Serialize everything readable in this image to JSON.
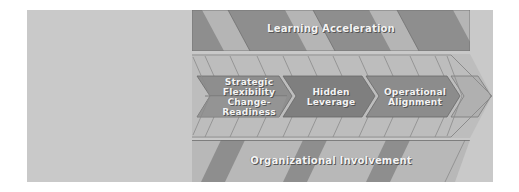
{
  "diagram": {
    "top_band": {
      "label": "Learning Acceleration"
    },
    "bottom_band": {
      "label": "Organizational Involvement"
    },
    "chevrons": [
      {
        "label_top": "Strategic Flexibility",
        "label_bottom": "Change-Readiness"
      },
      {
        "label": "Hidden Leverage"
      },
      {
        "label": "Operational Alignment"
      }
    ],
    "colors": {
      "background": "#c9c9c9",
      "band_dark": "#8c8c8c",
      "band_light": "#b3b3b3",
      "chevron_dark": "#8a8a8a",
      "chevron_light": "#b8b8b8",
      "label_text": "#f4f4f4"
    }
  }
}
